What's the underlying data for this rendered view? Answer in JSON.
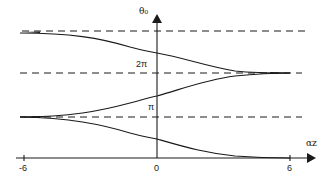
{
  "figure": {
    "y_axis_label": "θ₀",
    "x_axis_label": "αz",
    "x_ticks": [
      {
        "label": "-6",
        "value": -6
      },
      {
        "label": "0",
        "value": 0
      },
      {
        "label": "6",
        "value": 6
      }
    ],
    "y_marks": [
      {
        "label": "π",
        "value": "pi"
      },
      {
        "label": "2π",
        "value": "2pi"
      }
    ],
    "asymptotes": [
      "dashed line at lower level (π)",
      "dashed line at middle level (2π)",
      "dashed line at upper level (3π)"
    ],
    "curves": [
      {
        "name": "upper-curve",
        "from_level": "upper dashed line at αz=-6",
        "to_level": "middle dashed line at αz=6"
      },
      {
        "name": "middle-curve",
        "from_level": "lower dashed line at αz=-6",
        "to_level": "middle dashed line at αz=6"
      },
      {
        "name": "lower-curve",
        "from_level": "lower dashed line at αz=-6",
        "to_level": "x-axis (0) at αz=6"
      }
    ],
    "colors": {
      "ink": "#1a1a1a",
      "background": "#ffffff"
    }
  }
}
